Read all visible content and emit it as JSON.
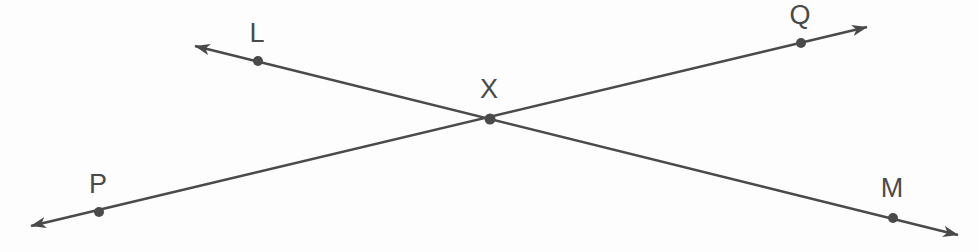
{
  "figure": {
    "type": "geometry-diagram",
    "background_color": "#fdfdfd",
    "stroke_color": "#4a4a4a",
    "stroke_width": 2.6,
    "dot_radius": 5,
    "width": 978,
    "height": 252
  },
  "labels": {
    "L": {
      "text": "L",
      "x": 257,
      "y": 33
    },
    "Q": {
      "text": "Q",
      "x": 800,
      "y": 15
    },
    "X": {
      "text": "X",
      "x": 489,
      "y": 89
    },
    "P": {
      "text": "P",
      "x": 98,
      "y": 184
    },
    "M": {
      "text": "M",
      "x": 892,
      "y": 188
    }
  },
  "points": [
    {
      "name": "L",
      "x": 258,
      "y": 61
    },
    {
      "name": "Q",
      "x": 801,
      "y": 43
    },
    {
      "name": "X",
      "x": 490,
      "y": 119
    },
    {
      "name": "P",
      "x": 99,
      "y": 212
    },
    {
      "name": "M",
      "x": 893,
      "y": 218
    }
  ],
  "lines": [
    {
      "name": "line-LM",
      "through": [
        "L",
        "X",
        "M"
      ],
      "start": {
        "x": 195,
        "y": 46
      },
      "end": {
        "x": 958,
        "y": 235
      },
      "arrow_start": true,
      "arrow_end": true
    },
    {
      "name": "line-PQ",
      "through": [
        "P",
        "X",
        "Q"
      ],
      "start": {
        "x": 31,
        "y": 226
      },
      "end": {
        "x": 867,
        "y": 27
      },
      "arrow_start": true,
      "arrow_end": true
    }
  ]
}
